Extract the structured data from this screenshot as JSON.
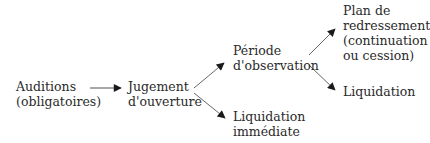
{
  "diagram": {
    "type": "flowchart",
    "nodes": {
      "auditions": {
        "lines": [
          "Auditions",
          "(obligatoires)"
        ]
      },
      "jugement": {
        "lines": [
          "Jugement",
          "d'ouverture"
        ]
      },
      "periode": {
        "lines": [
          "Période",
          "d'observation"
        ]
      },
      "liquidation_immediate": {
        "lines": [
          "Liquidation",
          "immédiate"
        ]
      },
      "plan": {
        "lines": [
          "Plan de",
          "redressement",
          "(continuation",
          "ou cession)"
        ]
      },
      "liquidation": {
        "lines": [
          "Liquidation"
        ]
      }
    },
    "edges": [
      {
        "from": "auditions",
        "to": "jugement"
      },
      {
        "from": "jugement",
        "to": "periode"
      },
      {
        "from": "jugement",
        "to": "liquidation_immediate"
      },
      {
        "from": "periode",
        "to": "plan"
      },
      {
        "from": "periode",
        "to": "liquidation"
      }
    ],
    "colors": {
      "text": "#2a2a2a",
      "arrow": "#555555",
      "arrowhead": "#1a1a1a"
    }
  }
}
